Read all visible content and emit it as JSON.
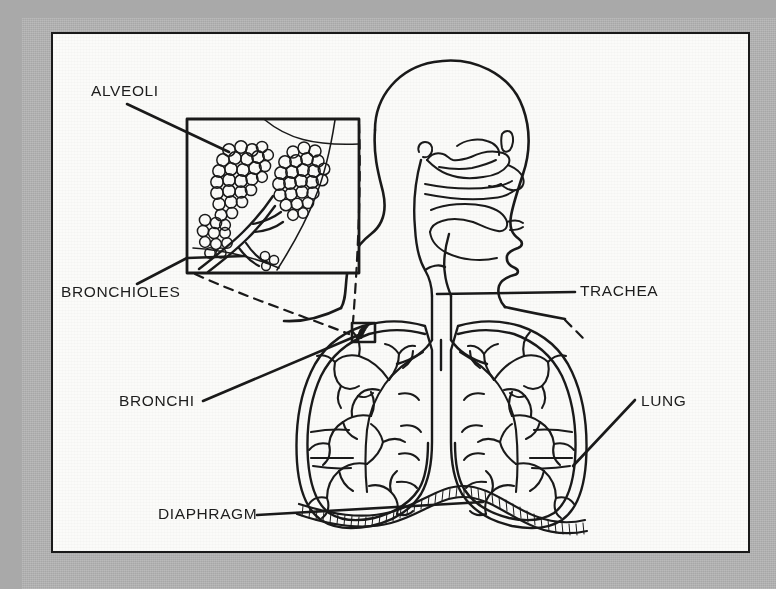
{
  "figure": {
    "style": "black line art on off-white plate with gray border",
    "colors": {
      "mat": "#adadad",
      "plate": "#fbfbf9",
      "ink": "#1a1a1a",
      "label_text": "#1d1d1d"
    }
  },
  "labels": {
    "alveoli": "ALVEOLI",
    "bronchioles": "BRONCHIOLES",
    "bronchi": "BRONCHI",
    "diaphragm": "DIAPHRAGM",
    "trachea": "TRACHEA",
    "lung": "LUNG"
  },
  "parts": [
    {
      "id": "alveoli",
      "label": "ALVEOLI",
      "label_x": 38,
      "label_y": 62,
      "anchor": "start",
      "description": "grape-like clusters of air sacs shown in the magnified inset"
    },
    {
      "id": "bronchioles",
      "label": "BRONCHIOLES",
      "label_x": 8,
      "label_y": 263,
      "anchor": "start",
      "description": "small airway branches feeding the alveolar clusters"
    },
    {
      "id": "bronchi",
      "label": "BRONCHI",
      "label_x": 66,
      "label_y": 372,
      "anchor": "start",
      "description": "large airways branching from the trachea into each lung"
    },
    {
      "id": "diaphragm",
      "label": "DIAPHRAGM",
      "label_x": 105,
      "label_y": 485,
      "anchor": "start",
      "description": "hatched muscular sheet beneath the lungs"
    },
    {
      "id": "trachea",
      "label": "TRACHEA",
      "label_x": 527,
      "label_y": 262,
      "anchor": "start",
      "description": "windpipe descending from the larynx to the bronchi"
    },
    {
      "id": "lung",
      "label": "LUNG",
      "label_x": 588,
      "label_y": 372,
      "anchor": "start",
      "description": "paired organs containing the bronchial tree"
    }
  ],
  "inset": {
    "name": "alveoli-magnifier-inset",
    "box": {
      "x": 134,
      "y": 85,
      "width": 172,
      "height": 154
    },
    "source_box": {
      "x": 300,
      "y": 290,
      "width": 22,
      "height": 18
    },
    "connector_style": "dashed"
  }
}
